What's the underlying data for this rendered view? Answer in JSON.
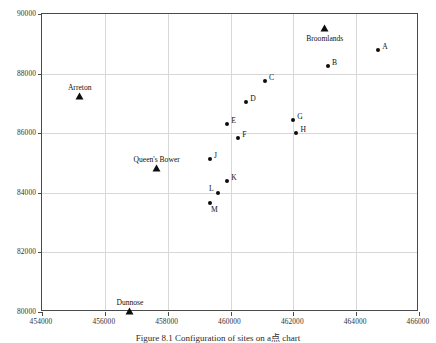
{
  "figure": {
    "caption": "Figure 8.1  Configuration of sites on a点 chart"
  },
  "chart_data": {
    "type": "scatter",
    "title": "",
    "xlabel": "",
    "ylabel": "",
    "xlim": [
      454000,
      466000
    ],
    "ylim": [
      80000,
      90000
    ],
    "grid": true,
    "legend": "none",
    "xticks": [
      454000,
      456000,
      458000,
      460000,
      462000,
      464000,
      466000
    ],
    "xtick_labels": [
      "454000",
      "456000",
      "458000",
      "460000",
      "462000",
      "464000",
      "466000"
    ],
    "yticks": [
      80000,
      82000,
      84000,
      86000,
      88000,
      90000
    ],
    "ytick_labels": [
      "80000",
      "82000",
      "84000",
      "86000",
      "88000",
      "90000"
    ],
    "series": [
      {
        "name": "sites",
        "marker": "circle",
        "points": [
          {
            "label": "A",
            "x": 464700,
            "y": 88800,
            "label_side": "right"
          },
          {
            "label": "B",
            "x": 463100,
            "y": 88250,
            "label_side": "right"
          },
          {
            "label": "C",
            "x": 461100,
            "y": 87750,
            "label_side": "right"
          },
          {
            "label": "D",
            "x": 460500,
            "y": 87050,
            "label_side": "right"
          },
          {
            "label": "E",
            "x": 459900,
            "y": 86300,
            "label_side": "right"
          },
          {
            "label": "F",
            "x": 460250,
            "y": 85850,
            "label_side": "right"
          },
          {
            "label": "G",
            "x": 462000,
            "y": 86450,
            "label_side": "right"
          },
          {
            "label": "H",
            "x": 462100,
            "y": 86000,
            "label_side": "right"
          },
          {
            "label": "J",
            "x": 459350,
            "y": 85150,
            "label_side": "right"
          },
          {
            "label": "K",
            "x": 459900,
            "y": 84400,
            "label_side": "right"
          },
          {
            "label": "L",
            "x": 459600,
            "y": 84000,
            "label_side": "left"
          },
          {
            "label": "M",
            "x": 459350,
            "y": 83650,
            "label_side": "below"
          }
        ]
      },
      {
        "name": "settlements",
        "marker": "triangle",
        "points": [
          {
            "label": "Arreton",
            "x": 455200,
            "y": 87200,
            "label_pos": "above"
          },
          {
            "label": "Broomlands",
            "x": 463000,
            "y": 89500,
            "label_pos": "below"
          },
          {
            "label": "Queen's Bower",
            "x": 457650,
            "y": 84800,
            "label_pos": "above"
          },
          {
            "label": "Dunnose",
            "x": 456800,
            "y": 80000,
            "label_pos": "above"
          }
        ]
      }
    ]
  }
}
